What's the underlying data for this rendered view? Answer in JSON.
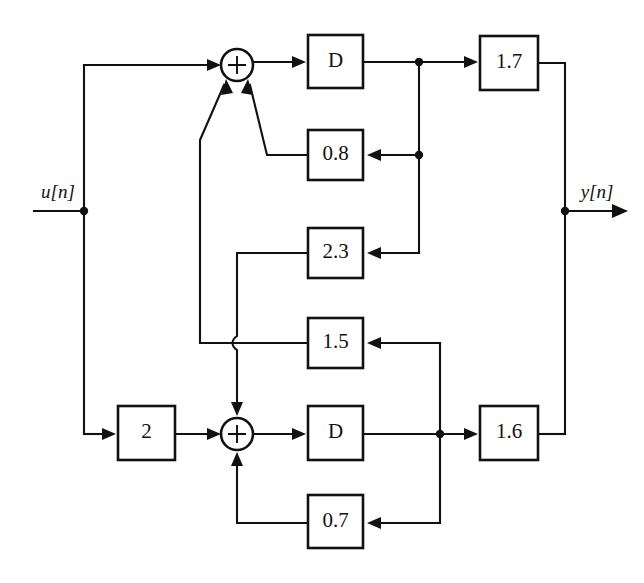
{
  "diagram": {
    "canvas": {
      "width": 644,
      "height": 583,
      "background": "#ffffff"
    },
    "line_color": "#111111",
    "io": {
      "input_label": "u[n]",
      "output_label": "y[n]"
    },
    "adders": [
      {
        "id": "adder-top",
        "symbol": "+",
        "cx": 237,
        "cy": 65,
        "r": 16
      },
      {
        "id": "adder-bottom",
        "symbol": "+",
        "cx": 237,
        "cy": 434,
        "r": 16
      }
    ],
    "blocks": [
      {
        "id": "delay-top",
        "label": "D",
        "x": 308,
        "y": 35,
        "w": 55,
        "h": 53
      },
      {
        "id": "gain-0p8",
        "label": "0.8",
        "x": 308,
        "y": 130,
        "w": 55,
        "h": 50
      },
      {
        "id": "gain-2p3",
        "label": "2.3",
        "x": 308,
        "y": 228,
        "w": 55,
        "h": 50
      },
      {
        "id": "gain-1p5",
        "label": "1.5",
        "x": 308,
        "y": 318,
        "w": 55,
        "h": 50
      },
      {
        "id": "gain-1p7",
        "label": "1.7",
        "x": 480,
        "y": 36,
        "w": 58,
        "h": 54
      },
      {
        "id": "gain-2",
        "label": "2",
        "x": 118,
        "y": 406,
        "w": 57,
        "h": 54
      },
      {
        "id": "delay-bot",
        "label": "D",
        "x": 308,
        "y": 406,
        "w": 55,
        "h": 54
      },
      {
        "id": "gain-0p7",
        "label": "0.7",
        "x": 308,
        "y": 495,
        "w": 55,
        "h": 53
      },
      {
        "id": "gain-1p6",
        "label": "1.6",
        "x": 480,
        "y": 406,
        "w": 58,
        "h": 54
      }
    ],
    "junction_dots": [
      {
        "id": "dot-input",
        "cx": 84,
        "cy": 211
      },
      {
        "id": "dot-delay-top",
        "cx": 419,
        "cy": 62
      },
      {
        "id": "dot-feedback-0p8",
        "cx": 419,
        "cy": 155
      },
      {
        "id": "dot-output",
        "cx": 565,
        "cy": 211
      },
      {
        "id": "dot-delay-bot",
        "cx": 440,
        "cy": 434
      }
    ],
    "signal_paths": [
      "u[n] -> top adder",
      "u[n] -> gain 2 -> bottom adder",
      "top adder -> D (top) -> gain 1.7 -> y[n]",
      "D (top) -> gain 0.8 -> top adder",
      "D (top) -> gain 2.3 -> bottom adder",
      "bottom adder -> D (bottom) -> gain 1.6 -> y[n]",
      "D (bottom) -> gain 1.5 -> top adder",
      "D (bottom) -> gain 0.7 -> bottom adder"
    ]
  }
}
